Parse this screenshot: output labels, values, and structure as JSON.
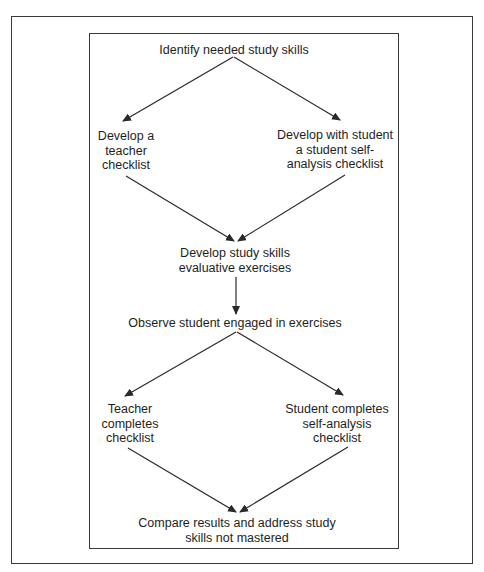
{
  "diagram": {
    "type": "flowchart",
    "nodes": {
      "identify": {
        "lines": [
          "Identify needed study skills"
        ]
      },
      "teacher_checklist": {
        "lines": [
          "Develop a",
          "teacher",
          "checklist"
        ]
      },
      "student_checklist": {
        "lines": [
          "Develop with student",
          "a student self-",
          "analysis checklist"
        ]
      },
      "exercises": {
        "lines": [
          "Develop study skills",
          "evaluative exercises"
        ]
      },
      "observe": {
        "lines": [
          "Observe student engaged in exercises"
        ]
      },
      "teacher_completes": {
        "lines": [
          "Teacher",
          "completes",
          "checklist"
        ]
      },
      "student_completes": {
        "lines": [
          "Student completes",
          "self-analysis",
          "checklist"
        ]
      },
      "compare": {
        "lines": [
          "Compare results and address study",
          "skills not mastered"
        ]
      }
    },
    "edges": [
      {
        "from": "identify",
        "to": "teacher_checklist"
      },
      {
        "from": "identify",
        "to": "student_checklist"
      },
      {
        "from": "teacher_checklist",
        "to": "exercises"
      },
      {
        "from": "student_checklist",
        "to": "exercises"
      },
      {
        "from": "exercises",
        "to": "observe"
      },
      {
        "from": "observe",
        "to": "teacher_completes"
      },
      {
        "from": "observe",
        "to": "student_completes"
      },
      {
        "from": "teacher_completes",
        "to": "compare"
      },
      {
        "from": "student_completes",
        "to": "compare"
      }
    ],
    "colors": {
      "line": "#2a2a2a",
      "text": "#1e1e1e",
      "background": "#ffffff"
    }
  }
}
